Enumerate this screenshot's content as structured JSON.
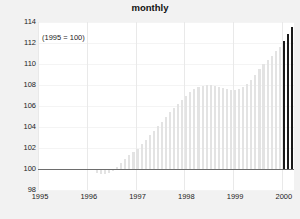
{
  "chart": {
    "title": "",
    "subtitle": "monthly",
    "annotation": "(1995 = 100)"
  },
  "chart_data": {
    "type": "bar",
    "title": "monthly",
    "subtitle": "monthly",
    "annotation": "(1995 = 100)",
    "xlabel": "",
    "ylabel": "",
    "ylim": [
      98,
      114
    ],
    "ytick_labels": [
      "114",
      "112",
      "110",
      "108",
      "106",
      "104",
      "102",
      "100",
      "98"
    ],
    "yticks": [
      114,
      112,
      110,
      108,
      106,
      104,
      102,
      100,
      98
    ],
    "xtick_labels": [
      "1995",
      "1996",
      "1997",
      "1998",
      "1999",
      "2000"
    ],
    "xticks": [
      1995,
      1996,
      1997,
      1998,
      1999,
      2000
    ],
    "grid": true,
    "legend": "none",
    "baseline": 100,
    "bar_color": "#e3e3e3",
    "highlight_color": "#1a1a1a",
    "highlight_count": 3,
    "x_start": 1995.0,
    "x_step_months": 1,
    "categories": [
      "1995-01",
      "1995-02",
      "1995-03",
      "1995-04",
      "1995-05",
      "1995-06",
      "1995-07",
      "1995-08",
      "1995-09",
      "1995-10",
      "1995-11",
      "1995-12",
      "1996-01",
      "1996-02",
      "1996-03",
      "1996-04",
      "1996-05",
      "1996-06",
      "1996-07",
      "1996-08",
      "1996-09",
      "1996-10",
      "1996-11",
      "1996-12",
      "1997-01",
      "1997-02",
      "1997-03",
      "1997-04",
      "1997-05",
      "1997-06",
      "1997-07",
      "1997-08",
      "1997-09",
      "1997-10",
      "1997-11",
      "1997-12",
      "1998-01",
      "1998-02",
      "1998-03",
      "1998-04",
      "1998-05",
      "1998-06",
      "1998-07",
      "1998-08",
      "1998-09",
      "1998-10",
      "1998-11",
      "1998-12",
      "1999-01",
      "1999-02",
      "1999-03",
      "1999-04",
      "1999-05",
      "1999-06",
      "1999-07",
      "1999-08",
      "1999-09",
      "1999-10",
      "1999-11",
      "1999-12",
      "2000-01",
      "2000-02",
      "2000-03"
    ],
    "values": [
      100.0,
      100.0,
      100.0,
      100.0,
      100.0,
      100.0,
      100.0,
      100.0,
      100.0,
      100.0,
      100.0,
      100.0,
      100.0,
      100.0,
      99.6,
      99.5,
      99.5,
      99.6,
      99.8,
      100.2,
      100.6,
      101.0,
      101.3,
      101.6,
      101.9,
      102.4,
      102.8,
      103.2,
      103.6,
      104.1,
      104.5,
      105.0,
      105.4,
      105.8,
      106.2,
      106.6,
      107.0,
      107.3,
      107.6,
      107.8,
      107.9,
      108.0,
      108.0,
      107.9,
      107.8,
      107.7,
      107.6,
      107.5,
      107.5,
      107.6,
      107.8,
      108.1,
      108.5,
      109.0,
      109.5,
      110.0,
      110.4,
      110.8,
      111.2,
      111.6,
      112.2,
      112.9,
      113.5
    ]
  }
}
